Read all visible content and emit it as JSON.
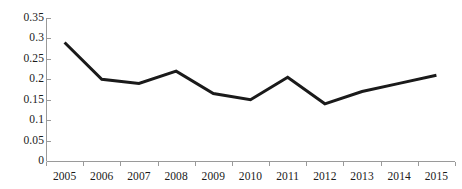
{
  "chart_data": {
    "type": "line",
    "title": "",
    "subtitle": "",
    "xlabel": "",
    "ylabel": "",
    "categories": [
      "2005",
      "2006",
      "2007",
      "2008",
      "2009",
      "2010",
      "2011",
      "2012",
      "2013",
      "2014",
      "2015"
    ],
    "series": [
      {
        "name": "",
        "values": [
          0.29,
          0.2,
          0.19,
          0.22,
          0.165,
          0.15,
          0.205,
          0.14,
          0.17,
          0.19,
          0.21
        ]
      }
    ],
    "ylim": [
      0,
      0.35
    ],
    "yticks": [
      "0",
      "0.05",
      "0.1",
      "0.15",
      "0.2",
      "0.25",
      "0.3",
      "0.35"
    ],
    "ytick_values": [
      0,
      0.05,
      0.1,
      0.15,
      0.2,
      0.25,
      0.3,
      0.35
    ],
    "grid": false,
    "legend": "none",
    "line_color": "#1a1a1a",
    "axis_color": "#9a9a9a",
    "background_color": "#ffffff",
    "markers": false,
    "line_width": 3
  }
}
